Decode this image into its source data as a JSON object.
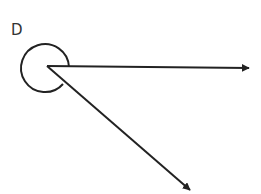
{
  "diagram": {
    "type": "angle",
    "vertex_label": "D",
    "stroke_color": "#222222",
    "background": "#ffffff",
    "vertex": {
      "x": 47,
      "y": 66
    },
    "arc": {
      "type": "reflex-angle-circle",
      "center": {
        "x": 45,
        "y": 66
      },
      "radius": 24
    },
    "rays": [
      {
        "name": "horizontal-ray",
        "from": {
          "x": 47,
          "y": 66
        },
        "to": {
          "x": 249,
          "y": 68
        },
        "arrowhead": true
      },
      {
        "name": "diagonal-ray",
        "from": {
          "x": 47,
          "y": 66
        },
        "to": {
          "x": 190,
          "y": 190
        },
        "arrowhead": true
      }
    ]
  }
}
